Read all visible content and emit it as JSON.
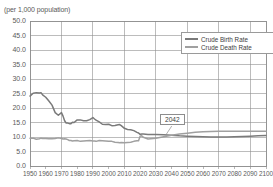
{
  "chart_data": {
    "type": "line",
    "title": "(per 1,000 population)",
    "xlabel": "",
    "ylabel": "(per 1,000 population)",
    "xlim": [
      1950,
      2100
    ],
    "ylim": [
      0.0,
      50.0
    ],
    "grid": true,
    "legend_position": "top-right",
    "yticks": [
      "0.0",
      "5.0",
      "10.0",
      "15.0",
      "20.0",
      "25.0",
      "30.0",
      "35.0",
      "40.0",
      "45.0",
      "50.0"
    ],
    "ytick_values": [
      0,
      5,
      10,
      15,
      20,
      25,
      30,
      35,
      40,
      45,
      50
    ],
    "xticks": [
      "1950",
      "1960",
      "1970",
      "1980",
      "1990",
      "2000",
      "2010",
      "2020",
      "2030",
      "2040",
      "2050",
      "2060",
      "2070",
      "2080",
      "2090",
      "2100"
    ],
    "xtick_values": [
      1950,
      1960,
      1970,
      1980,
      1990,
      2000,
      2010,
      2020,
      2030,
      2040,
      2050,
      2060,
      2070,
      2080,
      2090,
      2100
    ],
    "annotations": [
      {
        "label": "2042",
        "x": 2042,
        "y": 11.0,
        "note": "crossover of crude birth rate and crude death rate"
      }
    ],
    "x": [
      1950,
      1952,
      1954,
      1956,
      1957,
      1958,
      1960,
      1962,
      1964,
      1966,
      1968,
      1970,
      1971,
      1972,
      1973,
      1974,
      1975,
      1976,
      1977,
      1978,
      1980,
      1982,
      1984,
      1986,
      1988,
      1990,
      1991,
      1992,
      1994,
      1996,
      1998,
      2000,
      2002,
      2004,
      2006,
      2007,
      2008,
      2010,
      2012,
      2014,
      2016,
      2018,
      2019,
      2020,
      2021,
      2022,
      2025,
      2030,
      2035,
      2040,
      2042,
      2045,
      2050,
      2055,
      2060,
      2065,
      2070,
      2075,
      2080,
      2085,
      2090,
      2095,
      2100
    ],
    "series": [
      {
        "name": "Crude Birth Rate",
        "color": "#7a7a7a",
        "values": [
          24.1,
          25.1,
          25.3,
          25.2,
          25.3,
          24.5,
          23.7,
          22.4,
          21.0,
          18.4,
          17.5,
          18.4,
          17.2,
          15.6,
          14.8,
          14.8,
          14.6,
          14.6,
          15.1,
          15.0,
          15.9,
          15.9,
          15.6,
          15.6,
          16.0,
          16.7,
          16.2,
          15.8,
          15.2,
          14.4,
          14.3,
          14.4,
          13.9,
          14.0,
          14.2,
          14.3,
          13.9,
          13.0,
          12.6,
          12.5,
          12.2,
          11.6,
          11.4,
          10.9,
          11.0,
          11.0,
          10.9,
          10.9,
          10.8,
          10.6,
          10.5,
          10.4,
          10.3,
          10.2,
          10.1,
          10.0,
          10.0,
          10.0,
          10.1,
          10.2,
          10.3,
          10.4,
          10.5
        ]
      },
      {
        "name": "Crude Death Rate",
        "color": "#a0a0a0",
        "values": [
          9.6,
          9.6,
          9.2,
          9.4,
          9.6,
          9.5,
          9.5,
          9.4,
          9.4,
          9.5,
          9.7,
          9.5,
          9.3,
          9.4,
          9.3,
          9.1,
          8.8,
          8.8,
          8.6,
          8.7,
          8.8,
          8.5,
          8.6,
          8.7,
          8.8,
          8.6,
          8.6,
          8.5,
          8.8,
          8.7,
          8.6,
          8.5,
          8.5,
          8.2,
          8.1,
          8.0,
          8.1,
          8.0,
          8.1,
          8.2,
          8.5,
          8.7,
          8.7,
          10.3,
          10.4,
          9.9,
          9.3,
          9.6,
          10.1,
          10.6,
          10.8,
          11.0,
          11.3,
          11.6,
          11.8,
          11.9,
          12.0,
          12.0,
          12.0,
          12.0,
          12.0,
          12.0,
          12.0
        ]
      }
    ]
  },
  "legend": {
    "items": [
      {
        "label": "Crude Birth Rate",
        "color": "#7a7a7a"
      },
      {
        "label": "Crude Death Rate",
        "color": "#a0a0a0"
      }
    ]
  },
  "callout": {
    "label": "2042"
  },
  "colors": {
    "grid": "#8f8f8f",
    "frame": "#8a8a8a",
    "text": "#5a5a5a",
    "background": "#ffffff"
  }
}
